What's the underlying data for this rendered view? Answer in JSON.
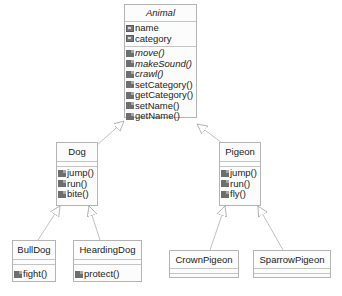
{
  "diagram": {
    "type": "UML class diagram",
    "classes": {
      "animal": {
        "name": "Animal",
        "abstract": true,
        "attributes": [
          "name",
          "category"
        ],
        "methods": [
          {
            "label": "move()",
            "abstract": true
          },
          {
            "label": "makeSound()",
            "abstract": true
          },
          {
            "label": "crawl()",
            "abstract": true
          },
          {
            "label": "setCategory()",
            "abstract": false
          },
          {
            "label": "getCategory()",
            "abstract": false
          },
          {
            "label": "setName()",
            "abstract": false
          },
          {
            "label": "getName()",
            "abstract": false
          }
        ]
      },
      "dog": {
        "name": "Dog",
        "methods": [
          "jump()",
          "run()",
          "bite()"
        ]
      },
      "pigeon": {
        "name": "Pigeon",
        "methods": [
          "jump()",
          "run()",
          "fly()"
        ]
      },
      "bulldog": {
        "name": "BullDog",
        "methods": [
          "fight()"
        ]
      },
      "heardingdog": {
        "name": "HeardingDog",
        "methods": [
          "protect()"
        ]
      },
      "crownpigeon": {
        "name": "CrownPigeon",
        "methods": []
      },
      "sparrowpigeon": {
        "name": "SparrowPigeon",
        "methods": []
      }
    },
    "relations": [
      {
        "from": "Dog",
        "to": "Animal",
        "type": "generalization"
      },
      {
        "from": "Pigeon",
        "to": "Animal",
        "type": "generalization"
      },
      {
        "from": "BullDog",
        "to": "Dog",
        "type": "generalization"
      },
      {
        "from": "HeardingDog",
        "to": "Dog",
        "type": "generalization"
      },
      {
        "from": "CrownPigeon",
        "to": "Pigeon",
        "type": "generalization"
      },
      {
        "from": "SparrowPigeon",
        "to": "Pigeon",
        "type": "generalization"
      }
    ],
    "colors": {
      "line": "#b0b0b0",
      "border": "#b4b4b4",
      "icon": "#6e6e6e"
    }
  }
}
